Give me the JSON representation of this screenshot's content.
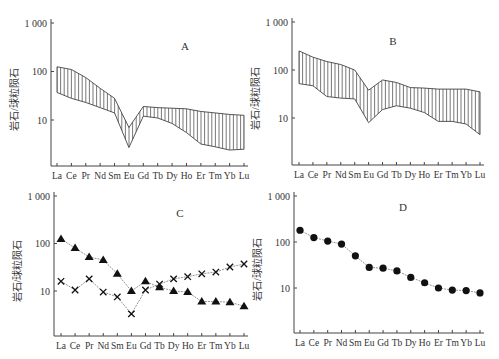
{
  "figure": {
    "y_axis_label": "岩石/球粒陨石",
    "elements": [
      "La",
      "Ce",
      "Pr",
      "Nd",
      "Sm",
      "Eu",
      "Gd",
      "Tb",
      "Dy",
      "Ho",
      "Er",
      "Tm",
      "Yb",
      "Lu"
    ],
    "y_ticks": [
      "1 000",
      "100",
      "10"
    ]
  },
  "chart_data": [
    {
      "type": "area",
      "panel": "A",
      "title": "A",
      "xlabel": "",
      "ylabel": "岩石/球粒陨石",
      "yscale": "log",
      "ylim": [
        1,
        1000
      ],
      "grid": false,
      "categories": [
        "La",
        "Ce",
        "Pr",
        "Nd",
        "Sm",
        "Eu",
        "Gd",
        "Tb",
        "Dy",
        "Ho",
        "Er",
        "Tm",
        "Yb",
        "Lu"
      ],
      "fill": "vertical-hatch",
      "series": [
        {
          "name": "upper",
          "values": [
            125,
            110,
            75,
            45,
            28,
            7,
            19,
            18,
            17.5,
            17,
            15,
            14,
            13,
            12.5
          ]
        },
        {
          "name": "lower",
          "values": [
            37,
            28,
            23,
            18,
            14,
            2.7,
            12,
            11,
            8.5,
            5.5,
            3.2,
            2.8,
            2.4,
            2.5
          ]
        }
      ]
    },
    {
      "type": "area",
      "panel": "B",
      "title": "B",
      "xlabel": "",
      "ylabel": "岩石/球粒陨石",
      "yscale": "log",
      "ylim": [
        1,
        1000
      ],
      "grid": false,
      "categories": [
        "La",
        "Ce",
        "Pr",
        "Nd",
        "Sm",
        "Eu",
        "Gd",
        "Tb",
        "Dy",
        "Ho",
        "Er",
        "Tm",
        "Yb",
        "Lu"
      ],
      "fill": "vertical-hatch",
      "series": [
        {
          "name": "upper",
          "values": [
            250,
            185,
            150,
            130,
            100,
            38,
            62,
            55,
            43,
            42,
            40,
            40,
            40,
            35
          ]
        },
        {
          "name": "lower",
          "values": [
            52,
            47,
            28,
            26,
            25,
            8,
            15,
            18,
            16,
            13,
            8.5,
            8.5,
            7.5,
            4.5
          ]
        }
      ]
    },
    {
      "type": "line",
      "panel": "C",
      "title": "C",
      "xlabel": "",
      "ylabel": "岩石/球粒陨石",
      "yscale": "log",
      "ylim": [
        1,
        1000
      ],
      "grid": false,
      "categories": [
        "La",
        "Ce",
        "Pr",
        "Nd",
        "Sm",
        "Eu",
        "Gd",
        "Tb",
        "Dy",
        "Ho",
        "Er",
        "Tm",
        "Yb",
        "Lu"
      ],
      "series": [
        {
          "name": "triangle",
          "marker": "filled-triangle",
          "values": [
            125,
            80,
            52,
            45,
            23,
            10,
            16,
            12,
            10,
            9.5,
            6,
            6,
            5.8,
            4.8
          ]
        },
        {
          "name": "cross",
          "marker": "x",
          "values": [
            16,
            10.5,
            18,
            9.5,
            7.5,
            3.3,
            10.5,
            14,
            18,
            20,
            23,
            25,
            32,
            37
          ]
        }
      ]
    },
    {
      "type": "line",
      "panel": "D",
      "title": "D",
      "xlabel": "",
      "ylabel": "岩石/球粒陨石",
      "yscale": "log",
      "ylim": [
        1,
        1000
      ],
      "grid": false,
      "categories": [
        "La",
        "Ce",
        "Pr",
        "Nd",
        "Sm",
        "Eu",
        "Gd",
        "Tb",
        "Dy",
        "Ho",
        "Er",
        "Tm",
        "Yb",
        "Lu"
      ],
      "series": [
        {
          "name": "circle",
          "marker": "filled-circle",
          "values": [
            180,
            125,
            105,
            90,
            50,
            28,
            27,
            23.5,
            17,
            13,
            10,
            9,
            8.8,
            7.8
          ]
        }
      ]
    }
  ]
}
